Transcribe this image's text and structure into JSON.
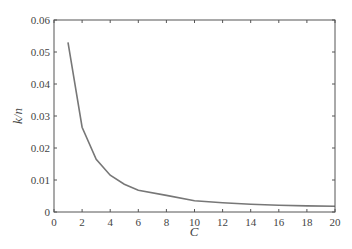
{
  "chart_data": {
    "type": "line",
    "title": "",
    "xlabel": "C",
    "ylabel": "k/n",
    "xlim": [
      0,
      20
    ],
    "ylim": [
      0,
      0.06
    ],
    "grid": false,
    "legend": null,
    "x_ticks": [
      "0",
      "2",
      "4",
      "6",
      "8",
      "10",
      "12",
      "14",
      "16",
      "18",
      "20"
    ],
    "y_ticks": [
      "0",
      "0.01",
      "0.02",
      "0.03",
      "0.04",
      "0.05",
      "0.06"
    ],
    "series": [
      {
        "name": "k/n",
        "color": "#777777",
        "x": [
          1,
          2,
          3,
          4,
          5,
          6,
          8,
          10,
          12,
          14,
          16,
          18,
          20
        ],
        "values": [
          0.053,
          0.0265,
          0.0165,
          0.0115,
          0.0087,
          0.0068,
          0.0052,
          0.0035,
          0.0029,
          0.0024,
          0.0021,
          0.0019,
          0.0018
        ]
      }
    ]
  }
}
